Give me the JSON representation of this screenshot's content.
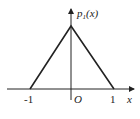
{
  "diagram": {
    "type": "function-plot",
    "function_label": "p",
    "function_subscript": "1",
    "function_arg": "(x)",
    "x_axis_label": "x",
    "origin_label": "O",
    "tick_labels": [
      "-1",
      "1"
    ],
    "shape": "triangle",
    "vertices": [
      [
        -1,
        0
      ],
      [
        0,
        1
      ],
      [
        1,
        0
      ]
    ],
    "colors": {
      "line": "#222222",
      "background": "#ffffff"
    }
  }
}
